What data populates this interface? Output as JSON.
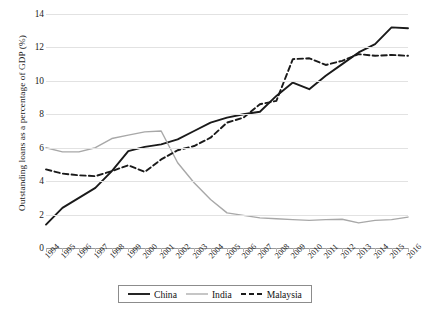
{
  "chart_data": {
    "type": "line",
    "title": "",
    "xlabel": "",
    "ylabel": "Outstanding loans as a percentage of GDP (%)",
    "ylim": [
      0,
      14
    ],
    "yticks": [
      0,
      2,
      4,
      6,
      8,
      10,
      12,
      14
    ],
    "grid": "horizontal",
    "legend_position": "bottom",
    "categories": [
      "1994",
      "1995",
      "1996",
      "1997",
      "1998",
      "1999",
      "2000",
      "2001",
      "2002",
      "2003",
      "2004",
      "2005",
      "2006",
      "2007",
      "2008",
      "2009",
      "2010",
      "2011",
      "2012",
      "2013",
      "2014",
      "2015",
      "2016"
    ],
    "series": [
      {
        "name": "China",
        "color": "#1a1a1a",
        "style": "solid",
        "values": [
          1.4,
          2.4,
          3.0,
          3.6,
          4.6,
          5.8,
          6.05,
          6.2,
          6.5,
          7.0,
          7.5,
          7.8,
          8.0,
          8.15,
          9.1,
          9.9,
          9.5,
          10.3,
          11.0,
          11.7,
          12.2,
          13.2,
          13.15
        ]
      },
      {
        "name": "India",
        "color": "#a8a8a8",
        "style": "solid",
        "values": [
          6.0,
          5.75,
          5.75,
          6.0,
          6.55,
          6.75,
          6.95,
          7.0,
          5.1,
          3.9,
          2.9,
          2.1,
          1.95,
          1.8,
          1.75,
          1.7,
          1.65,
          1.7,
          1.72,
          1.5,
          1.65,
          1.7,
          1.85
        ]
      },
      {
        "name": "Malaysia",
        "color": "#1a1a1a",
        "style": "dashed",
        "values": [
          4.7,
          4.45,
          4.35,
          4.3,
          4.6,
          4.95,
          4.55,
          5.3,
          5.85,
          6.1,
          6.6,
          7.5,
          7.8,
          8.6,
          8.8,
          11.3,
          11.35,
          10.95,
          11.2,
          11.6,
          11.5,
          11.55,
          11.5
        ]
      }
    ]
  },
  "legend": {
    "items": [
      {
        "label": "China"
      },
      {
        "label": "India"
      },
      {
        "label": "Malaysia"
      }
    ]
  }
}
